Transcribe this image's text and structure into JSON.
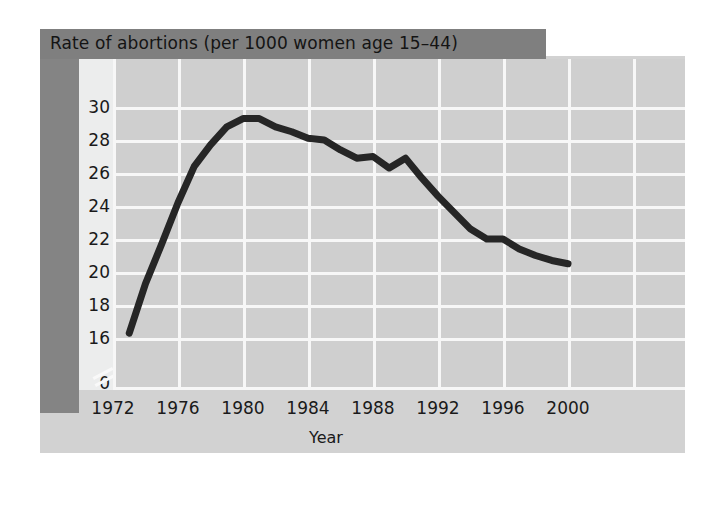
{
  "figure": {
    "title": "Rate of abortions (per 1000 women age 15–44)",
    "axis_title": "Year"
  },
  "colors": {
    "title_banner": "#7f7f7f",
    "spine": "#848484",
    "card_background": "#d2d2d2",
    "plot_background": "#cfcfcf",
    "gridline": "#f7f7f7",
    "series_line": "#262626",
    "tick_label": "#1a1a1a"
  },
  "chart_data": {
    "type": "line",
    "title": "Rate of abortions (per 1000 women age 15–44)",
    "xlabel": "Year",
    "ylabel": "",
    "xlim": [
      1972,
      2000
    ],
    "ylim": [
      15,
      31
    ],
    "xticks": [
      1972,
      1976,
      1980,
      1984,
      1988,
      1992,
      1996,
      2000
    ],
    "yticks": [
      0,
      16,
      18,
      20,
      22,
      24,
      26,
      28,
      30
    ],
    "y_axis_break": true,
    "y_axis_break_between": [
      0,
      16
    ],
    "grid": true,
    "legend": "none",
    "series": [
      {
        "name": "Rate of abortions per 1000 women age 15-44",
        "x": [
          1973,
          1974,
          1975,
          1976,
          1977,
          1978,
          1979,
          1980,
          1981,
          1982,
          1983,
          1984,
          1985,
          1986,
          1987,
          1988,
          1989,
          1990,
          1991,
          1992,
          1993,
          1994,
          1995,
          1996,
          1997,
          1998,
          1999,
          2000
        ],
        "values": [
          16.3,
          19.3,
          21.7,
          24.2,
          26.4,
          27.7,
          28.8,
          29.3,
          29.3,
          28.8,
          28.5,
          28.1,
          28.0,
          27.4,
          26.9,
          27.0,
          26.3,
          26.9,
          25.7,
          24.6,
          23.6,
          22.6,
          22.0,
          22.0,
          21.4,
          21.0,
          20.7,
          20.5
        ]
      }
    ]
  },
  "y_axis_labels": [
    "30",
    "28",
    "26",
    "24",
    "22",
    "20",
    "18",
    "16",
    "0"
  ],
  "x_axis_labels": [
    "1972",
    "1976",
    "1980",
    "1984",
    "1988",
    "1992",
    "1996",
    "2000"
  ]
}
